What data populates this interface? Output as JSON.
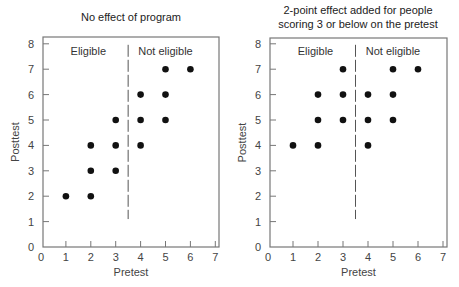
{
  "colors": {
    "frame": "#777777",
    "points": "#111111",
    "cutoff": "#555555",
    "text": "#333333"
  },
  "chart_data": [
    {
      "type": "scatter",
      "title": "No effect of program",
      "title_lines": [
        "No effect of program"
      ],
      "xlabel": "Pretest",
      "ylabel": "Posttest",
      "xlim": [
        0,
        7
      ],
      "ylim": [
        0,
        8
      ],
      "xticks": [
        0,
        1,
        2,
        3,
        4,
        5,
        6,
        7
      ],
      "yticks": [
        0,
        1,
        2,
        3,
        4,
        5,
        6,
        7,
        8
      ],
      "grid": false,
      "cutoff": {
        "x": 3.5,
        "y_from": 1.1,
        "y_to": 8,
        "style": "dashed"
      },
      "annotations": [
        {
          "text": "Eligible",
          "x": 1.9,
          "y": 7.7
        },
        {
          "text": "Not eligible",
          "x": 5.0,
          "y": 7.7
        }
      ],
      "points": [
        {
          "x": 1,
          "y": 2
        },
        {
          "x": 2,
          "y": 2
        },
        {
          "x": 2,
          "y": 3
        },
        {
          "x": 3,
          "y": 3
        },
        {
          "x": 2,
          "y": 4
        },
        {
          "x": 3,
          "y": 4
        },
        {
          "x": 4,
          "y": 4
        },
        {
          "x": 3,
          "y": 5
        },
        {
          "x": 4,
          "y": 5
        },
        {
          "x": 5,
          "y": 5
        },
        {
          "x": 4,
          "y": 6
        },
        {
          "x": 5,
          "y": 6
        },
        {
          "x": 5,
          "y": 7
        },
        {
          "x": 6,
          "y": 7
        }
      ]
    },
    {
      "type": "scatter",
      "title": "2-point effect added for people scoring 3 or below on the pretest",
      "title_lines": [
        "2-point effect added for people",
        "scoring 3 or below on the pretest"
      ],
      "xlabel": "Pretest",
      "ylabel": "Posttest",
      "xlim": [
        0,
        7
      ],
      "ylim": [
        0,
        8
      ],
      "xticks": [
        0,
        1,
        2,
        3,
        4,
        5,
        6,
        7
      ],
      "yticks": [
        0,
        1,
        2,
        3,
        4,
        5,
        6,
        7,
        8
      ],
      "grid": false,
      "cutoff": {
        "x": 3.5,
        "y_from": 1.1,
        "y_to": 8,
        "style": "dashed"
      },
      "annotations": [
        {
          "text": "Eligible",
          "x": 1.9,
          "y": 7.7
        },
        {
          "text": "Not eligible",
          "x": 5.0,
          "y": 7.7
        }
      ],
      "points": [
        {
          "x": 1,
          "y": 4
        },
        {
          "x": 2,
          "y": 4
        },
        {
          "x": 4,
          "y": 4
        },
        {
          "x": 2,
          "y": 5
        },
        {
          "x": 3,
          "y": 5
        },
        {
          "x": 4,
          "y": 5
        },
        {
          "x": 5,
          "y": 5
        },
        {
          "x": 2,
          "y": 6
        },
        {
          "x": 3,
          "y": 6
        },
        {
          "x": 4,
          "y": 6
        },
        {
          "x": 5,
          "y": 6
        },
        {
          "x": 3,
          "y": 7
        },
        {
          "x": 5,
          "y": 7
        },
        {
          "x": 6,
          "y": 7
        }
      ]
    }
  ],
  "layout": {
    "panels": [
      {
        "frame_left": 43,
        "frame_right": 219,
        "frame_top": 37,
        "x0": 41,
        "px_per_x": 24.9,
        "y0": 247,
        "px_per_y": 25.4,
        "title_center": 131,
        "title_y": [
          21
        ]
      },
      {
        "frame_left": 270,
        "frame_right": 447,
        "frame_top": 38,
        "x0": 268,
        "px_per_x": 25.0,
        "y0": 247,
        "px_per_y": 25.4,
        "title_center": 358,
        "title_y": [
          14,
          28
        ]
      }
    ]
  }
}
